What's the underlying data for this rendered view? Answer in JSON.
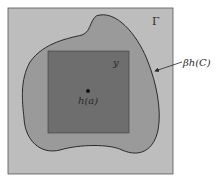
{
  "diagram": {
    "colors": {
      "background": "#ffffff",
      "outer_region": "#bdbdbd",
      "blob_region": "#9a9a9a",
      "inner_square": "#6e6e6e",
      "outline": "#2a2a2a",
      "point": "#111111"
    },
    "labels": {
      "outer_region": "Γ",
      "inner_square": "y",
      "point": "h(a)",
      "boundary": "βh(C)"
    },
    "elements": [
      {
        "id": "outer-region",
        "kind": "square",
        "label": "Γ"
      },
      {
        "id": "blob-region",
        "kind": "closed-curve",
        "label": "βh(C)",
        "annotated_by": "arrow"
      },
      {
        "id": "inner-square",
        "kind": "square",
        "label": "y"
      },
      {
        "id": "point",
        "kind": "dot",
        "label": "h(a)"
      }
    ]
  }
}
